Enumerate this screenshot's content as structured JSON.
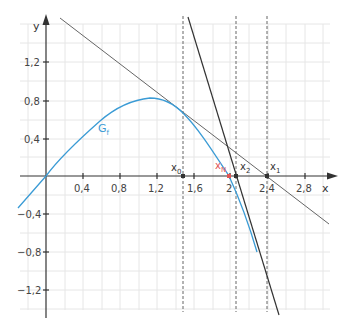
{
  "axes": {
    "x_label": "x",
    "y_label": "y",
    "x_ticks": [
      "0,4",
      "0,8",
      "1,2",
      "1,6",
      "2",
      "2,4",
      "2,8"
    ],
    "y_ticks": [
      "1,2",
      "0,8",
      "0,4",
      "−0,4",
      "−0,8",
      "−1,2"
    ]
  },
  "curve": {
    "label": "G",
    "subscript": "f",
    "color": "#3a9bd5"
  },
  "points": {
    "x0": {
      "label": "x",
      "sub": "0",
      "value": 1.48
    },
    "x1": {
      "label": "x",
      "sub": "1",
      "value": 2.39
    },
    "x2": {
      "label": "x",
      "sub": "2",
      "value": 2.06
    },
    "xN": {
      "label": "x",
      "sub": "N",
      "value": 2.0,
      "color": "#e05555"
    }
  },
  "tangents": [
    {
      "name": "tangent-at-x0",
      "color": "#555555"
    },
    {
      "name": "tangent-at-x1",
      "color": "#333333"
    }
  ]
}
